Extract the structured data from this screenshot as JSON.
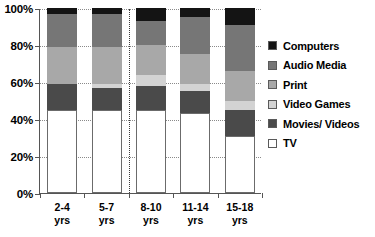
{
  "chart_data": {
    "type": "bar",
    "stacked": true,
    "normalized": "100%",
    "title": "",
    "subtitle": "",
    "xlabel": "",
    "ylabel": "",
    "ylim": [
      0,
      100
    ],
    "yticks": [
      "0%",
      "20%",
      "40%",
      "60%",
      "80%",
      "100%"
    ],
    "ytick_values": [
      0,
      20,
      40,
      60,
      80,
      100
    ],
    "grid": "horizontal-dotted",
    "legend_position": "right",
    "categories": [
      "2-4\nyrs",
      "5-7\nyrs",
      "8-10\nyrs",
      "11-14\nyrs",
      "15-18\nyrs"
    ],
    "category_labels": [
      {
        "line1": "2-4",
        "line2": "yrs"
      },
      {
        "line1": "5-7",
        "line2": "yrs"
      },
      {
        "line1": "8-10",
        "line2": "yrs"
      },
      {
        "line1": "11-14",
        "line2": "yrs"
      },
      {
        "line1": "15-18",
        "line2": "yrs"
      }
    ],
    "separator_after_category_index": 1,
    "series": [
      {
        "name": "TV",
        "color": "#ffffff",
        "outlined": true,
        "values": [
          45,
          45,
          45,
          43,
          31
        ]
      },
      {
        "name": "Movies/ Videos",
        "color": "#4a4a4a",
        "outlined": false,
        "values": [
          14,
          12,
          13,
          12,
          14
        ]
      },
      {
        "name": "Video Games",
        "color": "#d3d3d3",
        "outlined": false,
        "values": [
          0,
          2,
          6,
          4,
          5
        ]
      },
      {
        "name": "Print",
        "color": "#a8a8a8",
        "outlined": false,
        "values": [
          20,
          20,
          16,
          16,
          16
        ]
      },
      {
        "name": "Audio Media",
        "color": "#767676",
        "outlined": false,
        "values": [
          18,
          18,
          13,
          20,
          25
        ]
      },
      {
        "name": "Computers",
        "color": "#141414",
        "outlined": false,
        "values": [
          3,
          3,
          7,
          5,
          9
        ]
      }
    ]
  },
  "legend": {
    "items": [
      {
        "label": "Computers",
        "color": "#141414"
      },
      {
        "label": "Audio Media",
        "color": "#767676"
      },
      {
        "label": "Print",
        "color": "#a8a8a8"
      },
      {
        "label": "Video Games",
        "color": "#d3d3d3"
      },
      {
        "label": "Movies/ Videos",
        "color": "#4a4a4a"
      },
      {
        "label": "TV",
        "color": "#ffffff"
      }
    ]
  },
  "colors": {
    "axis": "#555555",
    "grid": "#8a8a8a",
    "separator": "#3a3a3a",
    "background": "#ffffff"
  }
}
